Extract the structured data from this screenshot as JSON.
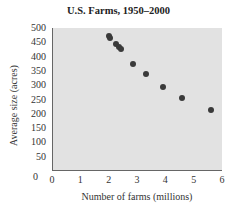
{
  "chart_data": {
    "type": "scatter",
    "title": "U.S. Farms, 1950–2000",
    "xlabel": "Number of farms (millions)",
    "ylabel": "Average size (acres)",
    "xlim": [
      0,
      6
    ],
    "ylim": [
      0,
      500
    ],
    "x_ticks": [
      "0",
      "1",
      "2",
      "3",
      "4",
      "5",
      "6"
    ],
    "y_ticks": [
      "0",
      "50",
      "100",
      "150",
      "200",
      "250",
      "300",
      "350",
      "400",
      "450",
      "500"
    ],
    "grid": false,
    "legend": null,
    "series": [
      {
        "name": "U.S. Farms",
        "points": [
          {
            "x": 2.0,
            "y": 472
          },
          {
            "x": 2.05,
            "y": 465
          },
          {
            "x": 2.25,
            "y": 445
          },
          {
            "x": 2.35,
            "y": 435
          },
          {
            "x": 2.45,
            "y": 425
          },
          {
            "x": 2.85,
            "y": 374
          },
          {
            "x": 3.3,
            "y": 338
          },
          {
            "x": 3.9,
            "y": 295
          },
          {
            "x": 4.6,
            "y": 256
          },
          {
            "x": 5.6,
            "y": 214
          }
        ]
      }
    ]
  }
}
